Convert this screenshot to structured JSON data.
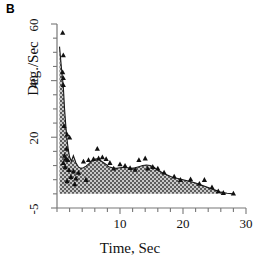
{
  "panel": {
    "label": "B"
  },
  "chart_data": {
    "type": "area",
    "title": "",
    "xlabel": "Time, Sec",
    "ylabel": "Deg./Sec",
    "xlim": [
      0,
      30
    ],
    "ylim": [
      -5,
      60
    ],
    "grid": false,
    "legend": "none",
    "xtick_labels": [
      "10",
      "20",
      "30"
    ],
    "xtick_values": [
      10,
      20,
      30
    ],
    "xminor_step": 2,
    "ytick_labels": [
      "-5",
      "20",
      "40",
      "60"
    ],
    "ytick_values": [
      -5,
      20,
      40,
      60
    ],
    "yminor_step": 5,
    "fill_color": "#8a8a8a",
    "line_color": "#1a1a1a",
    "marker_color": "#111111",
    "marker_shape": "triangle",
    "axis_color": "#777777",
    "series": [
      {
        "name": "mean curve",
        "x": [
          0.4,
          0.7,
          1.0,
          1.2,
          1.4,
          1.6,
          1.8,
          2.0,
          2.3,
          2.6,
          3.0,
          3.4,
          3.8,
          4.2,
          4.6,
          5.0,
          5.4,
          5.8,
          6.2,
          6.6,
          7.0,
          7.4,
          7.8,
          8.2,
          8.8,
          9.4,
          10.0,
          10.6,
          11.2,
          11.8,
          12.4,
          13.0,
          13.6,
          14.2,
          14.8,
          15.4,
          16.0,
          16.8,
          17.6,
          18.4,
          19.2,
          20.0,
          21.0,
          22.0,
          23.0,
          24.0,
          25.0,
          26.0,
          27.0,
          28.0
        ],
        "y": [
          52.0,
          44.5,
          38.0,
          30.0,
          24.0,
          19.0,
          15.5,
          13.0,
          11.5,
          13.5,
          11.0,
          9.5,
          9.0,
          9.2,
          9.8,
          10.5,
          11.4,
          12.0,
          12.4,
          12.2,
          11.6,
          11.0,
          10.4,
          9.6,
          9.2,
          9.0,
          9.2,
          9.4,
          9.2,
          9.0,
          9.2,
          9.6,
          10.0,
          10.2,
          10.0,
          9.4,
          8.4,
          7.4,
          6.6,
          5.8,
          5.4,
          5.0,
          4.4,
          3.8,
          3.0,
          2.2,
          1.4,
          0.6,
          0.2,
          0.0
        ]
      }
    ],
    "markers": [
      {
        "x": 0.9,
        "y": 57.0
      },
      {
        "x": 1.0,
        "y": 49.0
      },
      {
        "x": 0.9,
        "y": 43.0
      },
      {
        "x": 1.0,
        "y": 41.0
      },
      {
        "x": 1.0,
        "y": 38.5
      },
      {
        "x": 1.1,
        "y": 24.0
      },
      {
        "x": 1.6,
        "y": 21.0
      },
      {
        "x": 2.0,
        "y": 20.0
      },
      {
        "x": 1.5,
        "y": 16.0
      },
      {
        "x": 1.2,
        "y": 13.5
      },
      {
        "x": 1.4,
        "y": 12.5
      },
      {
        "x": 1.7,
        "y": 12.0
      },
      {
        "x": 1.0,
        "y": 11.0
      },
      {
        "x": 1.3,
        "y": 9.5
      },
      {
        "x": 1.9,
        "y": 8.5
      },
      {
        "x": 2.6,
        "y": 8.0
      },
      {
        "x": 3.4,
        "y": 7.5
      },
      {
        "x": 4.2,
        "y": 11.5
      },
      {
        "x": 5.0,
        "y": 12.0
      },
      {
        "x": 5.8,
        "y": 12.4
      },
      {
        "x": 6.4,
        "y": 16.0
      },
      {
        "x": 6.6,
        "y": 12.6
      },
      {
        "x": 7.2,
        "y": 13.0
      },
      {
        "x": 7.8,
        "y": 12.4
      },
      {
        "x": 8.4,
        "y": 11.0
      },
      {
        "x": 9.0,
        "y": 9.0
      },
      {
        "x": 10.0,
        "y": 10.5
      },
      {
        "x": 10.8,
        "y": 10.0
      },
      {
        "x": 11.6,
        "y": 9.2
      },
      {
        "x": 12.4,
        "y": 8.6
      },
      {
        "x": 13.0,
        "y": 12.0
      },
      {
        "x": 14.0,
        "y": 12.6
      },
      {
        "x": 14.4,
        "y": 9.0
      },
      {
        "x": 15.2,
        "y": 9.6
      },
      {
        "x": 16.0,
        "y": 9.0
      },
      {
        "x": 17.0,
        "y": 7.6
      },
      {
        "x": 18.6,
        "y": 6.2
      },
      {
        "x": 19.6,
        "y": 5.0
      },
      {
        "x": 21.2,
        "y": 5.2
      },
      {
        "x": 22.6,
        "y": 3.6
      },
      {
        "x": 23.4,
        "y": 5.0
      },
      {
        "x": 24.6,
        "y": 2.4
      },
      {
        "x": 25.6,
        "y": 1.0
      },
      {
        "x": 26.4,
        "y": 0.4
      },
      {
        "x": 28.0,
        "y": 0.2
      },
      {
        "x": 2.2,
        "y": 6.0
      },
      {
        "x": 3.0,
        "y": 5.5
      },
      {
        "x": 4.6,
        "y": 5.0
      },
      {
        "x": 1.6,
        "y": 4.5
      },
      {
        "x": 2.8,
        "y": 3.5
      }
    ]
  }
}
